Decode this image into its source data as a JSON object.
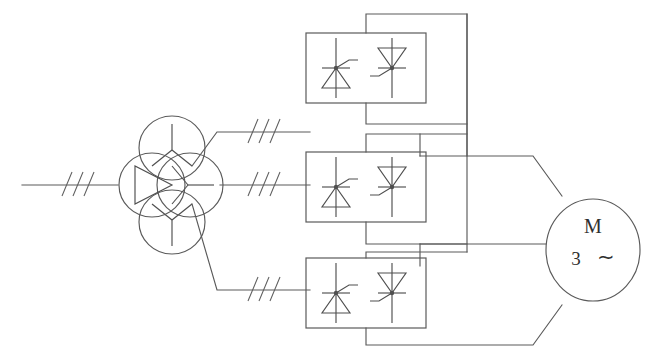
{
  "diagram": {
    "type": "electrical-schematic",
    "stroke_color": "#5a5a5a",
    "background_color": "#ffffff",
    "symbol_color": "#4f4f4f",
    "text_color": "#2f2f2f"
  },
  "supply": {
    "name": "three-phase-ac-supply-line",
    "phase_mark_label": "///",
    "phase_mark_count": 3,
    "description": "incoming three-phase mains line"
  },
  "transformer": {
    "name": "three-winding-transformer",
    "primary": {
      "name": "delta-winding",
      "symbol": "delta",
      "label": "D"
    },
    "secondaries": [
      {
        "name": "wye-winding-top",
        "symbol": "wye",
        "label": "Y"
      },
      {
        "name": "wye-winding-middle",
        "symbol": "wye",
        "label": "Y"
      },
      {
        "name": "wye-winding-bottom",
        "symbol": "wye",
        "label": "Y"
      }
    ]
  },
  "phase_marks": [
    {
      "name": "phase-mark-supply",
      "label": "///",
      "count": 3
    },
    {
      "name": "phase-mark-top-branch",
      "label": "///",
      "count": 3
    },
    {
      "name": "phase-mark-middle-branch",
      "label": "///",
      "count": 3
    },
    {
      "name": "phase-mark-bottom-branch",
      "label": "///",
      "count": 3
    }
  ],
  "converters": [
    {
      "name": "converter-block-top",
      "label": "",
      "thyristors": [
        {
          "name": "thyristor-forward",
          "orientation": "cathode-up",
          "gate": "upper-right"
        },
        {
          "name": "thyristor-reverse",
          "orientation": "cathode-down",
          "gate": "lower-left"
        }
      ]
    },
    {
      "name": "converter-block-middle",
      "label": "",
      "thyristors": [
        {
          "name": "thyristor-forward",
          "orientation": "cathode-up",
          "gate": "upper-right"
        },
        {
          "name": "thyristor-reverse",
          "orientation": "cathode-down",
          "gate": "lower-left"
        }
      ]
    },
    {
      "name": "converter-block-bottom",
      "label": "",
      "thyristors": [
        {
          "name": "thyristor-forward",
          "orientation": "cathode-up",
          "gate": "upper-right"
        },
        {
          "name": "thyristor-reverse",
          "orientation": "cathode-down",
          "gate": "lower-left"
        }
      ]
    }
  ],
  "motor": {
    "name": "three-phase-motor",
    "symbol_letter": "M",
    "phase_number": "3",
    "ac_symbol": "∼",
    "description": "three-phase AC motor"
  }
}
